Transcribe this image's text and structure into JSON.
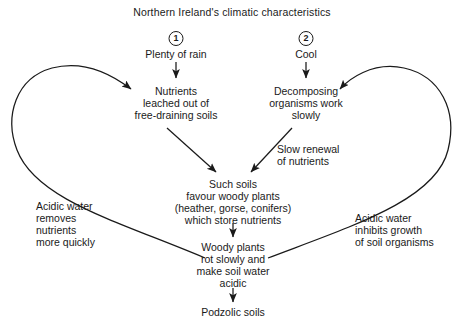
{
  "diagram": {
    "title": "Northern Ireland's climatic characteristics",
    "markers": [
      {
        "id": "marker-1",
        "label": "1"
      },
      {
        "id": "marker-2",
        "label": "2"
      }
    ],
    "nodes": [
      {
        "id": "plenty-of-rain",
        "text": "Plenty of rain"
      },
      {
        "id": "cool",
        "text": "Cool"
      },
      {
        "id": "nutrients-leached",
        "line1": "Nutrients",
        "line2": "leached out of",
        "line3": "free-draining soils"
      },
      {
        "id": "decomposing-organisms",
        "line1": "Decomposing",
        "line2": "organisms work",
        "line3": "slowly"
      },
      {
        "id": "such-soils",
        "line1": "Such soils",
        "line2": "favour woody plants",
        "line3": "(heather, gorse, conifers)",
        "line4": "which store nutrients"
      },
      {
        "id": "woody-plants-rot",
        "line1": "Woody plants",
        "line2": "rot slowly and",
        "line3": "make soil water",
        "line4": "acidic"
      },
      {
        "id": "podzolic-soils",
        "text": "Podzolic soils"
      }
    ],
    "edge_labels": [
      {
        "id": "slow-renewal",
        "line1": "Slow renewal",
        "line2": "of nutrients"
      },
      {
        "id": "acidic-removes",
        "line1": "Acidic water",
        "line2": "removes",
        "line3": "nutrients",
        "line4": "more quickly"
      },
      {
        "id": "acidic-inhibits",
        "line1": "Acidic water",
        "line2": "inhibits growth",
        "line3": "of soil organisms"
      }
    ],
    "colors": {
      "ink": "#1a1a1a",
      "background": "#ffffff"
    }
  }
}
